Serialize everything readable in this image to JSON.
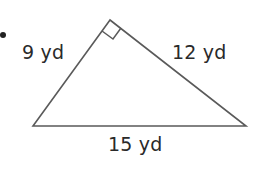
{
  "diagram": {
    "type": "right-triangle",
    "sides": {
      "left_leg": "9 yd",
      "right_leg": "12 yd",
      "hypotenuse": "15 yd"
    },
    "right_angle_marker": true,
    "bullet": true,
    "colors": {
      "stroke": "#555555",
      "text": "#2a2a2a",
      "background": "#ffffff"
    }
  }
}
